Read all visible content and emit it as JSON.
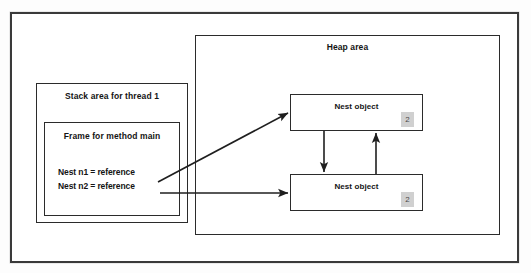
{
  "diagram": {
    "regions": {
      "heap": {
        "label": "Heap area"
      },
      "stack": {
        "label": "Stack area for thread 1"
      },
      "frame": {
        "label": "Frame for method main"
      }
    },
    "variables": [
      {
        "label": "Nest n1 = reference"
      },
      {
        "label": "Nest n2 = reference"
      }
    ],
    "objects": [
      {
        "label": "Nest object",
        "count": "2"
      },
      {
        "label": "Nest object",
        "count": "2"
      }
    ],
    "colors": {
      "border": "#2b2b2b",
      "frame_border": "#3a3a3a",
      "badge_background": "#d0d0d0",
      "badge_text": "#4a4a4a",
      "text": "#141414",
      "surface": "#ffffff",
      "canvas": "#fdfdfd"
    }
  }
}
